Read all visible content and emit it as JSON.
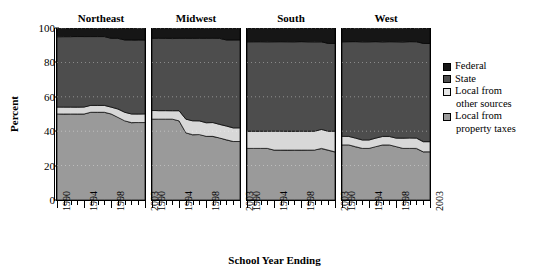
{
  "chart_data": {
    "type": "area",
    "title": "",
    "xlabel": "School Year Ending",
    "ylabel": "Percent",
    "ylim": [
      0,
      100
    ],
    "xlim": [
      1990,
      2003
    ],
    "yticks": [
      0,
      20,
      40,
      60,
      80,
      100
    ],
    "xticks": [
      1990,
      1994,
      1998,
      2003
    ],
    "xtick_labels": [
      "1990",
      "1994",
      "1998",
      "2003"
    ],
    "grid": true,
    "grid_style": "dotted",
    "stacked": true,
    "stack_order_bottom_to_top": [
      "Local from property taxes",
      "Local from other sources",
      "State",
      "Federal"
    ],
    "legend_position": "right",
    "panels": [
      "Northeast",
      "Midwest",
      "South",
      "West"
    ],
    "x": [
      1990,
      1991,
      1992,
      1993,
      1994,
      1995,
      1996,
      1997,
      1998,
      1999,
      2000,
      2001,
      2002,
      2003
    ],
    "panel_data": [
      {
        "panel": "Northeast",
        "series": [
          {
            "name": "Local from property taxes",
            "color": "#9a9a9a",
            "values": [
              50,
              50,
              50,
              50,
              50,
              51,
              51,
              51,
              50,
              48,
              46,
              45,
              45,
              45
            ]
          },
          {
            "name": "Local from other sources",
            "color": "#d8d8d8",
            "values": [
              4,
              4,
              4,
              4,
              4,
              4,
              4,
              4,
              4,
              5,
              5,
              5,
              5,
              5
            ]
          },
          {
            "name": "State",
            "color": "#4d4d4d",
            "values": [
              41,
              41,
              41,
              41,
              41,
              40,
              40,
              40,
              40,
              41,
              42,
              43,
              43,
              43
            ]
          },
          {
            "name": "Federal",
            "color": "#161616",
            "values": [
              5,
              5,
              5,
              5,
              5,
              5,
              5,
              5,
              6,
              6,
              7,
              7,
              7,
              7
            ]
          }
        ]
      },
      {
        "panel": "Midwest",
        "series": [
          {
            "name": "Local from property taxes",
            "color": "#9a9a9a",
            "values": [
              47,
              47,
              47,
              47,
              46,
              39,
              38,
              38,
              37,
              37,
              36,
              35,
              34,
              34
            ]
          },
          {
            "name": "Local from other sources",
            "color": "#d8d8d8",
            "values": [
              5,
              5,
              5,
              5,
              6,
              8,
              8,
              8,
              8,
              8,
              8,
              8,
              8,
              8
            ]
          },
          {
            "name": "State",
            "color": "#4d4d4d",
            "values": [
              42,
              42,
              42,
              42,
              42,
              47,
              48,
              48,
              49,
              49,
              50,
              50,
              51,
              51
            ]
          },
          {
            "name": "Federal",
            "color": "#161616",
            "values": [
              6,
              6,
              6,
              6,
              6,
              6,
              6,
              6,
              6,
              6,
              6,
              7,
              7,
              7
            ]
          }
        ]
      },
      {
        "panel": "South",
        "series": [
          {
            "name": "Local from property taxes",
            "color": "#9a9a9a",
            "values": [
              30,
              30,
              30,
              30,
              29,
              29,
              29,
              29,
              29,
              29,
              29,
              30,
              29,
              28
            ]
          },
          {
            "name": "Local from other sources",
            "color": "#d8d8d8",
            "values": [
              10,
              10,
              10,
              10,
              11,
              11,
              11,
              11,
              11,
              11,
              11,
              11,
              11,
              12
            ]
          },
          {
            "name": "State",
            "color": "#4d4d4d",
            "values": [
              52,
              52,
              52,
              52,
              52,
              52,
              52,
              52,
              52,
              52,
              52,
              51,
              51,
              51
            ]
          },
          {
            "name": "Federal",
            "color": "#161616",
            "values": [
              8,
              8,
              8,
              8,
              8,
              8,
              8,
              8,
              8,
              8,
              8,
              8,
              9,
              9
            ]
          }
        ]
      },
      {
        "panel": "West",
        "series": [
          {
            "name": "Local from property taxes",
            "color": "#9a9a9a",
            "values": [
              32,
              32,
              31,
              30,
              30,
              31,
              32,
              32,
              31,
              30,
              30,
              30,
              28,
              28
            ]
          },
          {
            "name": "Local from other sources",
            "color": "#d8d8d8",
            "values": [
              5,
              5,
              5,
              5,
              5,
              5,
              5,
              5,
              5,
              6,
              6,
              6,
              6,
              6
            ]
          },
          {
            "name": "State",
            "color": "#4d4d4d",
            "values": [
              55,
              55,
              56,
              57,
              57,
              56,
              55,
              55,
              56,
              56,
              56,
              56,
              57,
              57
            ]
          },
          {
            "name": "Federal",
            "color": "#161616",
            "values": [
              8,
              8,
              8,
              8,
              8,
              8,
              8,
              8,
              8,
              8,
              8,
              8,
              9,
              9
            ]
          }
        ]
      }
    ],
    "legend": [
      {
        "label": "Federal",
        "color": "#161616",
        "wrap": ""
      },
      {
        "label": "State",
        "color": "#4d4d4d",
        "wrap": ""
      },
      {
        "label": "Local from",
        "color": "#e6e6e6",
        "wrap": "other sources"
      },
      {
        "label": "Local from",
        "color": "#9a9a9a",
        "wrap": "property taxes"
      }
    ]
  },
  "axes": {
    "ylabel": "Percent",
    "xlabel": "School Year Ending",
    "yticks": [
      "100",
      "80",
      "60",
      "40",
      "20",
      "0"
    ],
    "xticks": [
      "1990",
      "1994",
      "1998",
      "2003"
    ]
  },
  "panels": [
    {
      "title": "Northeast"
    },
    {
      "title": "Midwest"
    },
    {
      "title": "South"
    },
    {
      "title": "West"
    }
  ],
  "legend": {
    "items": [
      {
        "label": "Federal",
        "cont": ""
      },
      {
        "label": "State",
        "cont": ""
      },
      {
        "label": "Local from",
        "cont": "other sources"
      },
      {
        "label": "Local from",
        "cont": "property taxes"
      }
    ]
  }
}
